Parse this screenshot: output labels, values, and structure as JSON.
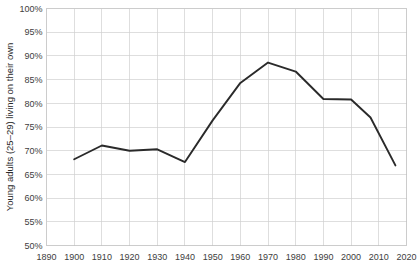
{
  "chart_data": {
    "type": "line",
    "title": "",
    "xlabel": "",
    "ylabel": "Young adults (25–29) living on their own",
    "xlim": [
      1890,
      2020
    ],
    "ylim": [
      50,
      100
    ],
    "grid": true,
    "legend_position": "none",
    "x_tick_labels": [
      "1890",
      "1900",
      "1910",
      "1920",
      "1930",
      "1940",
      "1950",
      "1960",
      "1970",
      "1980",
      "1990",
      "2000",
      "2010",
      "2020"
    ],
    "y_tick_labels": [
      "50%",
      "55%",
      "60%",
      "65%",
      "70%",
      "75%",
      "80%",
      "85%",
      "90%",
      "95%",
      "100%"
    ],
    "x_ticks": [
      1890,
      1900,
      1910,
      1920,
      1930,
      1940,
      1950,
      1960,
      1970,
      1980,
      1990,
      2000,
      2010,
      2020
    ],
    "y_ticks": [
      50,
      55,
      60,
      65,
      70,
      75,
      80,
      85,
      90,
      95,
      100
    ],
    "series": [
      {
        "name": "Young adults (25–29) living on their own",
        "color": "#2a2a2a",
        "x": [
          1900,
          1910,
          1920,
          1930,
          1940,
          1950,
          1960,
          1970,
          1980,
          1990,
          2000,
          2007,
          2016
        ],
        "values": [
          68.2,
          71.1,
          70.0,
          70.3,
          67.6,
          76.4,
          84.3,
          88.6,
          86.7,
          80.9,
          80.8,
          77.0,
          66.9
        ]
      }
    ]
  },
  "colors": {
    "line": "#2a2a2a",
    "grid": "#d0d0d0",
    "border": "#bfbfbf",
    "tick_text": "#404040",
    "background": "#ffffff"
  }
}
